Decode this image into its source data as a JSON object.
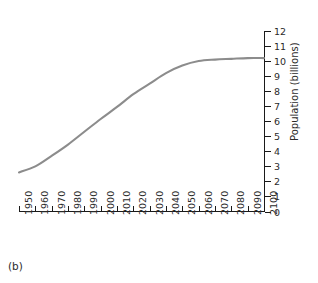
{
  "caption": "(b)",
  "chart_data": {
    "type": "line",
    "title": "",
    "subtitle": "",
    "xlabel": "",
    "ylabel": "Population (billions)",
    "xlim": [
      1950,
      2100
    ],
    "ylim": [
      0,
      12
    ],
    "grid": false,
    "legend": false,
    "legend_position": "none",
    "line_color": "#8c8c8c",
    "axis_color": "#1a1a1a",
    "x_tick_labels": [
      "1950",
      "1960",
      "1970",
      "1980",
      "1990",
      "2000",
      "2010",
      "2020",
      "2030",
      "2040",
      "2050",
      "2060",
      "2070",
      "2080",
      "2090",
      "2100"
    ],
    "y_tick_labels": [
      "0",
      "1",
      "2",
      "3",
      "4",
      "5",
      "6",
      "7",
      "8",
      "9",
      "10",
      "11",
      "12"
    ],
    "y_axis_side": "right",
    "series": [
      {
        "name": "World population projection",
        "x": [
          1950,
          1960,
          1970,
          1980,
          1990,
          2000,
          2010,
          2020,
          2030,
          2040,
          2050,
          2060,
          2070,
          2080,
          2090,
          2100
        ],
        "values": [
          2.6,
          3.0,
          3.7,
          4.45,
          5.3,
          6.15,
          6.95,
          7.8,
          8.5,
          9.2,
          9.7,
          10.0,
          10.1,
          10.15,
          10.2,
          10.2
        ]
      }
    ]
  }
}
